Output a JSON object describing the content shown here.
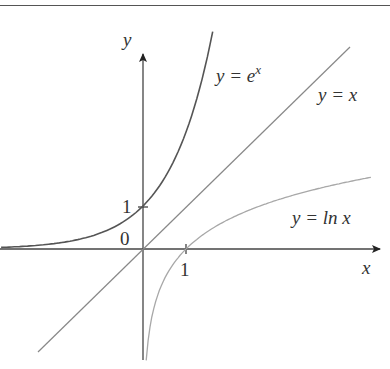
{
  "chart_data": {
    "type": "line",
    "title": "",
    "xlabel": "x",
    "ylabel": "y",
    "origin_label": "0",
    "x_ticks": [
      {
        "value": 1,
        "label": "1"
      }
    ],
    "y_ticks": [
      {
        "value": 1,
        "label": "1"
      }
    ],
    "xlim": [
      -3.3,
      5.5
    ],
    "ylim": [
      -2.6,
      4.5
    ],
    "grid": false,
    "series": [
      {
        "name": "y = e^x",
        "label_main": "y = e",
        "label_sup": "x",
        "function": "exp(x)",
        "color": "#555555",
        "points": [
          [
            -3.3,
            0.037
          ],
          [
            -2,
            0.135
          ],
          [
            -1,
            0.368
          ],
          [
            0,
            1
          ],
          [
            0.5,
            1.649
          ],
          [
            1,
            2.718
          ],
          [
            1.5,
            4.48
          ]
        ]
      },
      {
        "name": "y = x",
        "label_main": "y = x",
        "function": "x",
        "color": "#888888",
        "points": [
          [
            -2.4,
            -2.4
          ],
          [
            4.8,
            4.8
          ]
        ]
      },
      {
        "name": "y = ln x",
        "label_main": "y = ln x",
        "function": "ln(x)",
        "color": "#a8a8a8",
        "points": [
          [
            0.08,
            -2.5
          ],
          [
            0.5,
            -0.693
          ],
          [
            1,
            0
          ],
          [
            2,
            0.693
          ],
          [
            3,
            1.099
          ],
          [
            4,
            1.386
          ],
          [
            5.3,
            1.668
          ]
        ]
      }
    ]
  }
}
